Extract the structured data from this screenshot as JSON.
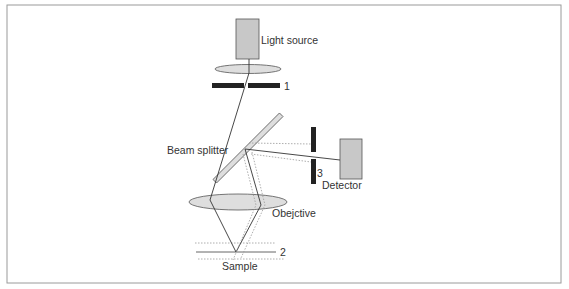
{
  "diagram": {
    "labels": {
      "light_source": "Light source",
      "pinhole_1": "1",
      "beam_splitter": "Beam splitter",
      "pinhole_3": "3",
      "detector": "Detector",
      "objective": "Obejctive",
      "sample_plane": "2",
      "sample": "Sample"
    },
    "colors": {
      "frame": "#9a9a9a",
      "component_fill": "#c8c8c8",
      "lens_fill": "#dedede",
      "aperture": "#222222",
      "ray": "#333333",
      "ray_dotted": "#999999"
    }
  }
}
